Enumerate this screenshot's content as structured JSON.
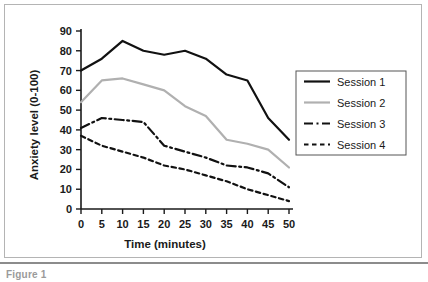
{
  "figure": {
    "caption": "Figure 1",
    "border_color": "#b4b4b4"
  },
  "chart_data": {
    "type": "line",
    "title": "",
    "xlabel": "Time (minutes)",
    "ylabel": "Anxiety level (0-100)",
    "x": [
      0,
      5,
      10,
      15,
      20,
      25,
      30,
      35,
      40,
      45,
      50
    ],
    "xlim": [
      0,
      50
    ],
    "ylim": [
      0,
      90
    ],
    "xticks": [
      0,
      5,
      10,
      15,
      20,
      25,
      30,
      35,
      40,
      45,
      50
    ],
    "yticks": [
      0,
      10,
      20,
      30,
      40,
      50,
      60,
      70,
      80,
      90
    ],
    "xtick_labels": [
      "0",
      "5",
      "10",
      "15",
      "20",
      "25",
      "30",
      "35",
      "40",
      "45",
      "50"
    ],
    "ytick_labels": [
      "0",
      "10",
      "20",
      "30",
      "40",
      "50",
      "60",
      "70",
      "80",
      "90"
    ],
    "grid": false,
    "legend_position": "right",
    "series": [
      {
        "name": "Session 1",
        "values": [
          70,
          76,
          85,
          80,
          78,
          80,
          76,
          68,
          65,
          46,
          35
        ],
        "color": "#111111",
        "style": "solid",
        "width": 2.2
      },
      {
        "name": "Session 2",
        "values": [
          54,
          65,
          66,
          63,
          60,
          52,
          47,
          35,
          33,
          30,
          21
        ],
        "color": "#b0b0b0",
        "style": "solid",
        "width": 2.2
      },
      {
        "name": "Session 3",
        "values": [
          41,
          46,
          45,
          44,
          32,
          29,
          26,
          22,
          21,
          18,
          11
        ],
        "color": "#111111",
        "style": "dashdot",
        "width": 2.2
      },
      {
        "name": "Session 4",
        "values": [
          37,
          32,
          29,
          26,
          22,
          20,
          17,
          14,
          10,
          7,
          4
        ],
        "color": "#111111",
        "style": "dotted",
        "width": 2.2
      }
    ]
  },
  "legend": {
    "entries": [
      {
        "label": "Session 1"
      },
      {
        "label": "Session 2"
      },
      {
        "label": "Session 3"
      },
      {
        "label": "Session 4"
      }
    ]
  }
}
